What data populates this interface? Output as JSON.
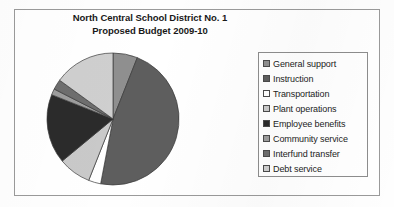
{
  "chart_data": {
    "type": "pie",
    "title": "North Central School District No. 1\nProposed Budget 2009-10",
    "title_line1": "North Central School District No. 1",
    "title_line2": "Proposed Budget 2009-10",
    "legend_position": "right",
    "grid": false,
    "start_angle_deg": 0,
    "direction": "clockwise",
    "categories": [
      "General support",
      "Instruction",
      "Transportation",
      "Plant operations",
      "Employee benefits",
      "Community service",
      "Interfund transfer",
      "Debt service"
    ],
    "values": [
      6.0,
      47.0,
      3.0,
      8.0,
      17.0,
      1.5,
      2.5,
      15.0
    ],
    "unit": "percent",
    "colors": [
      "#8f8f8f",
      "#5e5e5e",
      "#ffffff",
      "#c9c9c9",
      "#2b2b2b",
      "#9d9d9d",
      "#6e6e6e",
      "#cfcfcf"
    ],
    "slices": [
      {
        "label": "General support",
        "value": 6.0,
        "color": "#8f8f8f"
      },
      {
        "label": "Instruction",
        "value": 47.0,
        "color": "#5e5e5e"
      },
      {
        "label": "Transportation",
        "value": 3.0,
        "color": "#ffffff"
      },
      {
        "label": "Plant operations",
        "value": 8.0,
        "color": "#c9c9c9"
      },
      {
        "label": "Employee benefits",
        "value": 17.0,
        "color": "#2b2b2b"
      },
      {
        "label": "Community service",
        "value": 1.5,
        "color": "#9d9d9d"
      },
      {
        "label": "Interfund transfer",
        "value": 2.5,
        "color": "#6e6e6e"
      },
      {
        "label": "Debt service",
        "value": 15.0,
        "color": "#cfcfcf"
      }
    ],
    "xlabel": "",
    "ylabel": ""
  },
  "legend": {
    "items": [
      {
        "label": "General support",
        "color": "#8f8f8f"
      },
      {
        "label": "Instruction",
        "color": "#5e5e5e"
      },
      {
        "label": "Transportation",
        "color": "#ffffff"
      },
      {
        "label": "Plant operations",
        "color": "#c9c9c9"
      },
      {
        "label": "Employee benefits",
        "color": "#2b2b2b"
      },
      {
        "label": "Community service",
        "color": "#9d9d9d"
      },
      {
        "label": "Interfund transfer",
        "color": "#6e6e6e"
      },
      {
        "label": "Debt service",
        "color": "#cfcfcf"
      }
    ]
  }
}
